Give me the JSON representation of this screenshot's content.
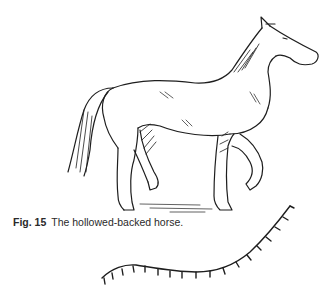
{
  "figure": {
    "label": "Fig. 15",
    "caption": "The hollowed-backed horse.",
    "illustration": "horse-line-drawing",
    "diagram": "hollow-spine-curve"
  },
  "colors": {
    "ink": "#1e1e1e",
    "background": "#ffffff"
  }
}
